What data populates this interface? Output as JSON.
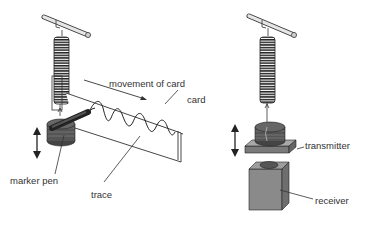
{
  "diagram": {
    "left": {
      "labels": {
        "movement": "movement of card",
        "card": "card",
        "marker_pen": "marker pen",
        "trace": "trace"
      }
    },
    "right": {
      "labels": {
        "transmitter": "transmitter",
        "receiver": "receiver"
      }
    }
  },
  "colors": {
    "line": "#333333",
    "rod_fill": "#e0e0e0",
    "coil_fill": "#555555",
    "box_fill": "#8a8a8a",
    "box_side": "#6e6e6e",
    "plate_fill": "#a5a5a5"
  }
}
